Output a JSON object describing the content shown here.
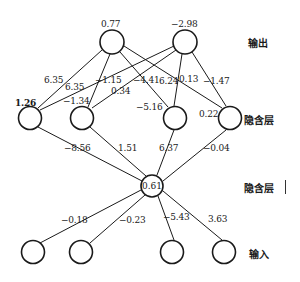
{
  "diagram": {
    "type": "neural-network",
    "layer_labels": {
      "output": "输出",
      "hidden1": "隐含层",
      "hidden2": "隐含层",
      "input": "输入"
    },
    "output_nodes": [
      {
        "id": "o1",
        "bias": "0.77"
      },
      {
        "id": "o2",
        "bias": "−2.98"
      }
    ],
    "hidden1_nodes": [
      {
        "id": "h1",
        "bias": "1.26"
      },
      {
        "id": "h2",
        "bias": "−1.34"
      },
      {
        "id": "h3",
        "bias": "−5.16"
      },
      {
        "id": "h4",
        "bias": "0.22"
      }
    ],
    "hidden2_node": {
      "id": "m",
      "bias": "0.61"
    },
    "input_nodes": [
      {
        "id": "i1"
      },
      {
        "id": "i2"
      },
      {
        "id": "i3"
      },
      {
        "id": "i4"
      }
    ],
    "weights_output_hidden1": {
      "w_h1_o1": "6.35",
      "w_h1_o2": "6.35",
      "w_h2_o1": "−1.15",
      "w_h2_o2": "0.34",
      "w_h3_o1": "−4.41",
      "w_h3_o2": "6.24",
      "w_h4_o1": "0.13",
      "w_h4_o2": "−1.47"
    },
    "weights_hidden1_hidden2": {
      "w_h1_m": "−8.56",
      "w_h2_m": "1.51",
      "w_h3_m": "6.37",
      "w_h4_m": "−0.04"
    },
    "weights_hidden2_input": {
      "w_i1_m": "−0.18",
      "w_i2_m": "−0.23",
      "w_i3_m": "−5.43",
      "w_i4_m": "3.63"
    }
  }
}
